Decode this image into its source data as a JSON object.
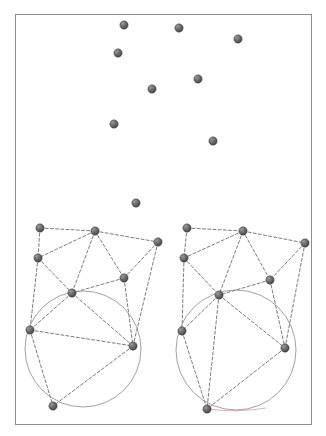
{
  "figure": {
    "title": "",
    "background_color": "#ffffff",
    "border_color": "#8c8c8c",
    "border_width": 1,
    "frame": {
      "x": 15,
      "y": 14,
      "width": 296,
      "height": 410
    }
  },
  "style": {
    "node_fill": "#565656",
    "node_highlight": "#8e8e8e",
    "node_stroke": "#3a3a3a",
    "node_radius": 4.2,
    "edge_color": "#5a5a5a",
    "edge_width": 0.8,
    "edge_dash": "3,2.2",
    "circle_color": "#8a8a8a",
    "circle_width": 0.8,
    "accent_color": "#c46a6a"
  },
  "chart_data": {
    "type": "scatter",
    "title": "",
    "xlabel": "",
    "ylabel": "",
    "xlim": [
      15,
      311
    ],
    "ylim": [
      14,
      424
    ],
    "grid": false,
    "legend": "none",
    "panels": [
      {
        "name": "scatter-point-cloud",
        "description": "unconnected point set in upper region",
        "points": [
          {
            "id": "p1",
            "x": 124,
            "y": 25
          },
          {
            "id": "p2",
            "x": 179,
            "y": 28
          },
          {
            "id": "p3",
            "x": 238,
            "y": 39
          },
          {
            "id": "p4",
            "x": 118,
            "y": 53
          },
          {
            "id": "p5",
            "x": 198,
            "y": 79
          },
          {
            "id": "p6",
            "x": 152,
            "y": 89
          },
          {
            "id": "p7",
            "x": 114,
            "y": 124
          },
          {
            "id": "p8",
            "x": 213,
            "y": 141
          },
          {
            "id": "p9",
            "x": 136,
            "y": 203
          }
        ]
      },
      {
        "name": "graph-left",
        "description": "left triangulation graph with circumcircle",
        "nodes": [
          {
            "id": "L0",
            "x": 40,
            "y": 228
          },
          {
            "id": "L1",
            "x": 95,
            "y": 231
          },
          {
            "id": "L2",
            "x": 158,
            "y": 242
          },
          {
            "id": "L3",
            "x": 38,
            "y": 258
          },
          {
            "id": "L4",
            "x": 124,
            "y": 278
          },
          {
            "id": "L5",
            "x": 72,
            "y": 293
          },
          {
            "id": "L6",
            "x": 30,
            "y": 330
          },
          {
            "id": "L7",
            "x": 133,
            "y": 346
          },
          {
            "id": "L8",
            "x": 53,
            "y": 406
          }
        ],
        "edges": [
          [
            "L0",
            "L1"
          ],
          [
            "L0",
            "L3"
          ],
          [
            "L1",
            "L2"
          ],
          [
            "L1",
            "L3"
          ],
          [
            "L1",
            "L4"
          ],
          [
            "L1",
            "L5"
          ],
          [
            "L2",
            "L4"
          ],
          [
            "L2",
            "L7"
          ],
          [
            "L3",
            "L5"
          ],
          [
            "L3",
            "L6"
          ],
          [
            "L4",
            "L5"
          ],
          [
            "L4",
            "L7"
          ],
          [
            "L5",
            "L6"
          ],
          [
            "L5",
            "L7"
          ],
          [
            "L6",
            "L7"
          ],
          [
            "L6",
            "L8"
          ],
          [
            "L7",
            "L8"
          ]
        ],
        "circle": {
          "cx": 83,
          "cy": 349,
          "r": 58
        },
        "circle_through": [
          "L6",
          "L7",
          "L8"
        ]
      },
      {
        "name": "graph-right",
        "description": "right triangulation graph with circumcircle",
        "nodes": [
          {
            "id": "R0",
            "x": 187,
            "y": 228
          },
          {
            "id": "R1",
            "x": 243,
            "y": 231
          },
          {
            "id": "R2",
            "x": 305,
            "y": 243
          },
          {
            "id": "R3",
            "x": 184,
            "y": 258
          },
          {
            "id": "R4",
            "x": 270,
            "y": 280
          },
          {
            "id": "R5",
            "x": 219,
            "y": 295
          },
          {
            "id": "R6",
            "x": 182,
            "y": 331
          },
          {
            "id": "R7",
            "x": 285,
            "y": 348
          },
          {
            "id": "R8",
            "x": 207,
            "y": 409
          }
        ],
        "edges": [
          [
            "R0",
            "R1"
          ],
          [
            "R0",
            "R3"
          ],
          [
            "R1",
            "R2"
          ],
          [
            "R1",
            "R3"
          ],
          [
            "R1",
            "R4"
          ],
          [
            "R1",
            "R5"
          ],
          [
            "R2",
            "R4"
          ],
          [
            "R2",
            "R7"
          ],
          [
            "R3",
            "R5"
          ],
          [
            "R3",
            "R6"
          ],
          [
            "R4",
            "R5"
          ],
          [
            "R4",
            "R7"
          ],
          [
            "R5",
            "R6"
          ],
          [
            "R5",
            "R7"
          ],
          [
            "R5",
            "R8"
          ],
          [
            "R6",
            "R8"
          ],
          [
            "R7",
            "R8"
          ]
        ],
        "circle": {
          "cx": 236,
          "cy": 350,
          "r": 60
        },
        "circle_through": [
          "R5",
          "R7",
          "R8"
        ]
      }
    ]
  }
}
